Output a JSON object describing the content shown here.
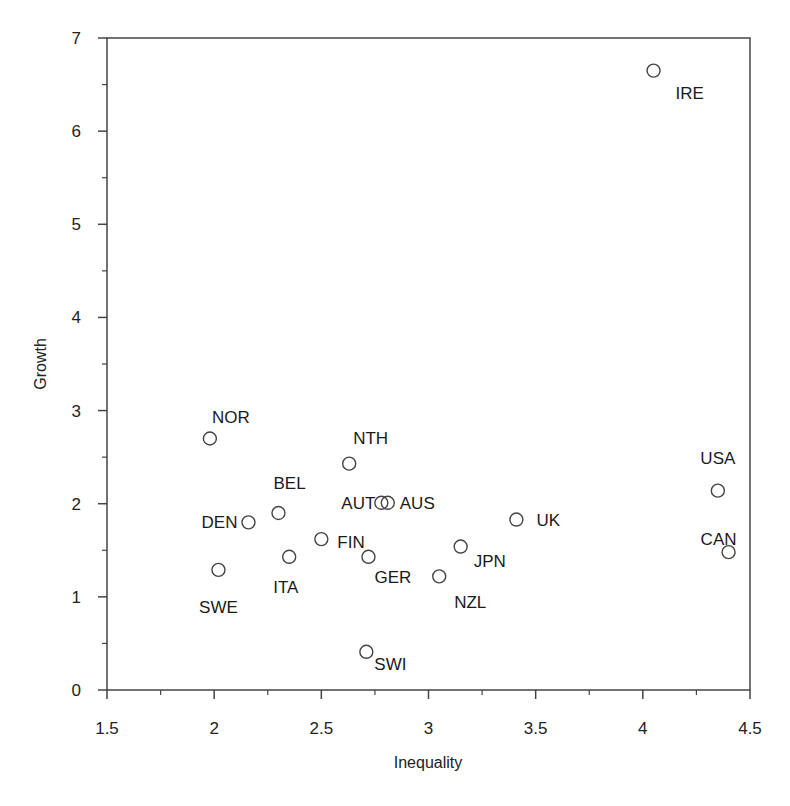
{
  "chart_data": {
    "type": "scatter",
    "title": "",
    "xlabel": "Inequality",
    "ylabel": "Growth",
    "xlim": [
      1.5,
      4.5
    ],
    "ylim": [
      0,
      7
    ],
    "xticks": [
      1.5,
      2,
      2.5,
      3,
      3.5,
      4,
      4.5
    ],
    "xtick_labels": [
      "1.5",
      "2",
      "2.5",
      "3",
      "3.5",
      "4",
      "4.5"
    ],
    "yticks": [
      0,
      1,
      2,
      3,
      4,
      5,
      6,
      7
    ],
    "ytick_labels": [
      "0",
      "1",
      "2",
      "3",
      "4",
      "5",
      "6",
      "7"
    ],
    "grid": false,
    "legend": null,
    "marker": "open-circle",
    "points": [
      {
        "label": "IRE",
        "x": 4.05,
        "y": 6.65,
        "lx": 22,
        "ly": 28,
        "anchor": "start"
      },
      {
        "label": "NOR",
        "x": 1.98,
        "y": 2.7,
        "lx": 2,
        "ly": -16,
        "anchor": "start"
      },
      {
        "label": "NTH",
        "x": 2.63,
        "y": 2.43,
        "lx": 4,
        "ly": -20,
        "anchor": "start"
      },
      {
        "label": "USA",
        "x": 4.35,
        "y": 2.14,
        "lx": 0,
        "ly": -27,
        "anchor": "middle"
      },
      {
        "label": "BEL",
        "x": 2.3,
        "y": 1.9,
        "lx": -5,
        "ly": -24,
        "anchor": "start"
      },
      {
        "label": "AUT",
        "x": 2.78,
        "y": 2.01,
        "lx": -6,
        "ly": 6,
        "anchor": "end"
      },
      {
        "label": "AUS",
        "x": 2.81,
        "y": 2.01,
        "lx": 12,
        "ly": 6,
        "anchor": "start"
      },
      {
        "label": "DEN",
        "x": 2.16,
        "y": 1.8,
        "lx": -11,
        "ly": 6,
        "anchor": "end"
      },
      {
        "label": "UK",
        "x": 3.41,
        "y": 1.83,
        "lx": 20,
        "ly": 6,
        "anchor": "start"
      },
      {
        "label": "FIN",
        "x": 2.5,
        "y": 1.62,
        "lx": 16,
        "ly": 9,
        "anchor": "start"
      },
      {
        "label": "CAN",
        "x": 4.4,
        "y": 1.48,
        "lx": -10,
        "ly": -7,
        "anchor": "middle"
      },
      {
        "label": "JPN",
        "x": 3.15,
        "y": 1.54,
        "lx": 13,
        "ly": 20,
        "anchor": "start"
      },
      {
        "label": "ITA",
        "x": 2.35,
        "y": 1.43,
        "lx": -16,
        "ly": 36,
        "anchor": "start"
      },
      {
        "label": "GER",
        "x": 2.72,
        "y": 1.43,
        "lx": 6,
        "ly": 26,
        "anchor": "start"
      },
      {
        "label": "SWE",
        "x": 2.02,
        "y": 1.29,
        "lx": 0,
        "ly": 43,
        "anchor": "middle"
      },
      {
        "label": "NZL",
        "x": 3.05,
        "y": 1.22,
        "lx": 15,
        "ly": 32,
        "anchor": "start"
      },
      {
        "label": "SWI",
        "x": 2.71,
        "y": 0.41,
        "lx": 8,
        "ly": 18,
        "anchor": "start"
      }
    ]
  },
  "plot": {
    "left": 107,
    "right": 750,
    "top": 38,
    "bottom": 690
  }
}
